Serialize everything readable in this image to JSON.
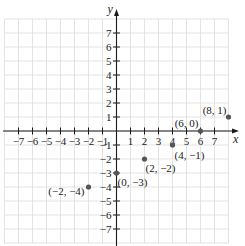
{
  "chart_data": {
    "type": "scatter",
    "title": "",
    "xlabel": "x",
    "ylabel": "y",
    "xlim": [
      -8,
      8
    ],
    "ylim": [
      -8,
      8
    ],
    "grid": true,
    "x_ticks": [
      -7,
      -6,
      -5,
      -4,
      -3,
      -2,
      -1,
      1,
      2,
      3,
      4,
      5,
      6,
      7
    ],
    "y_ticks": [
      -7,
      -6,
      -5,
      -4,
      -3,
      -2,
      -1,
      1,
      2,
      3,
      4,
      5,
      6,
      7
    ],
    "x_tick_labels": [
      "−7",
      "−6",
      "−5",
      "−4",
      "−3",
      "−2",
      "−1",
      "1",
      "2",
      "3",
      "4",
      "5",
      "6",
      "7"
    ],
    "y_tick_labels": [
      "−7",
      "−6",
      "−5",
      "−4",
      "−3",
      "−2",
      "−1",
      "1",
      "2",
      "3",
      "4",
      "5",
      "6",
      "7"
    ],
    "series": [
      {
        "name": "points",
        "points": [
          {
            "x": 8,
            "y": 1,
            "label": "(8, 1)"
          },
          {
            "x": 6,
            "y": 0,
            "label": "(6, 0)"
          },
          {
            "x": 4,
            "y": -1,
            "label": "(4, −1)"
          },
          {
            "x": 2,
            "y": -2,
            "label": "(2, −2)"
          },
          {
            "x": 0,
            "y": -3,
            "label": "(0, −3)"
          },
          {
            "x": -2,
            "y": -4,
            "label": "(−2, −4)"
          }
        ]
      }
    ]
  },
  "colors": {
    "grid": "#dcdcdc",
    "axis": "#1a1a1a",
    "point": "#555555"
  }
}
